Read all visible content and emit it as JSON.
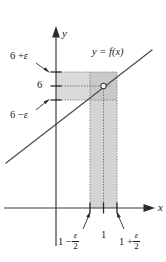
{
  "figure": {
    "type": "epsilon-delta-limit-diagram",
    "axes": {
      "x_axis_label": "x",
      "y_axis_label": "y"
    },
    "curve": {
      "label_prefix": "y = f(",
      "label_var": "x",
      "label_suffix": ")",
      "label_full": "y = f(x)"
    },
    "y_ticks": [
      {
        "id": "upper",
        "prefix": "6 +",
        "symbol": "ε",
        "text": "6 + ε"
      },
      {
        "id": "center",
        "prefix": "6",
        "symbol": "",
        "text": "6"
      },
      {
        "id": "lower",
        "prefix": "6 −",
        "symbol": "ε",
        "text": "6 − ε"
      }
    ],
    "x_ticks": [
      {
        "id": "left",
        "lead": "1 −",
        "num": "ε",
        "den": "2",
        "text": "1 − ε/2"
      },
      {
        "id": "center",
        "lead": "1",
        "num": "",
        "den": "",
        "text": "1"
      },
      {
        "id": "right",
        "lead": "1 +",
        "num": "ε",
        "den": "2",
        "text": "1 + ε/2"
      }
    ],
    "point": {
      "name": "open-circle-point",
      "x_label": "1",
      "y_label": "6",
      "style": "hollow"
    },
    "colors": {
      "band_fill": "#d4d4d4",
      "band_fill_light": "#dedede",
      "stroke": "#4a4a4a",
      "axis": "#3a3a3a",
      "text": "#1a1a1a",
      "dotted": "#8a8a8a"
    }
  }
}
